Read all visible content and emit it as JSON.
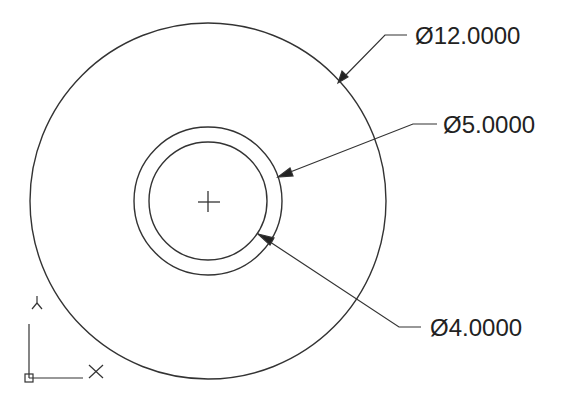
{
  "drawing": {
    "center": {
      "x": 208,
      "y": 201
    },
    "circles": [
      {
        "name": "outer",
        "radius_px": 178,
        "diameter_label": "Ø12.0000"
      },
      {
        "name": "middle",
        "radius_px": 74,
        "diameter_label": "Ø5.0000"
      },
      {
        "name": "inner",
        "radius_px": 59,
        "diameter_label": "Ø4.0000"
      }
    ],
    "stroke_color": "#333333"
  },
  "dimensions": {
    "d12": {
      "label": "Ø12.0000"
    },
    "d5": {
      "label": "Ø5.0000"
    },
    "d4": {
      "label": "Ø4.0000"
    }
  },
  "ucs": {
    "x_label": "X",
    "y_label": "Y"
  }
}
